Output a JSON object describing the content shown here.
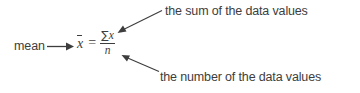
{
  "figure": {
    "kind": "math-formula-callout-diagram",
    "background_color": "#ffffff",
    "text_color": "#3d3d3d",
    "label_mean": "mean",
    "annotation_top": "the sum of the data values",
    "annotation_bottom": "the number of the data values"
  },
  "formula": {
    "variable": "x",
    "variable_overline": true,
    "equals": "=",
    "numerator_operator": "∑",
    "numerator_variable": "x",
    "denominator": "n",
    "plain_text": "x̄ = ∑x / n"
  },
  "arrows": {
    "mean_pointer": {
      "name": "arrow-mean-to-formula",
      "direction": "right",
      "from": [
        47,
        46
      ],
      "to": [
        73,
        46
      ]
    },
    "sum_pointer": {
      "name": "arrow-to-numerator",
      "direction": "down-left",
      "from": [
        163,
        10
      ],
      "to": [
        118,
        32
      ]
    },
    "count_pointer": {
      "name": "arrow-to-denominator",
      "direction": "up-left",
      "from": [
        160,
        72
      ],
      "to": [
        122,
        55
      ]
    }
  }
}
